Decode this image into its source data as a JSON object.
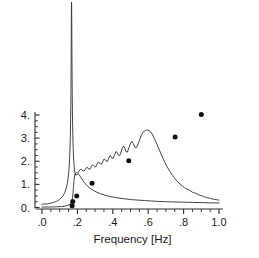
{
  "chart_data": {
    "type": "line",
    "title": "",
    "xlabel": "Frequency [Hz]",
    "ylabel": "",
    "xlim": [
      0.0,
      1.0
    ],
    "ylim": [
      0.0,
      4.55
    ],
    "grid": false,
    "legend": "none",
    "xticks": [
      0.0,
      0.2,
      0.4,
      0.6,
      0.8,
      1.0
    ],
    "xticklabels": [
      ".0",
      ".2",
      ".4",
      ".6",
      ".8",
      "1.0"
    ],
    "xminor_step": 0.05,
    "yticks": [
      0,
      1,
      2,
      3,
      4
    ],
    "yticklabels": [
      "0.",
      "1.",
      "2.",
      "3.",
      "4."
    ],
    "yminor_step": 0.25,
    "note": "Narrow resonance curve is clipped by the top of the axes near f=0.165",
    "series": [
      {
        "name": "narrow-resonance-curve",
        "type": "line",
        "clipped_at_top": true,
        "points": [
          [
            0.0,
            0.14
          ],
          [
            0.015,
            0.15
          ],
          [
            0.03,
            0.16
          ],
          [
            0.045,
            0.18
          ],
          [
            0.06,
            0.21
          ],
          [
            0.07,
            0.23
          ],
          [
            0.08,
            0.26
          ],
          [
            0.09,
            0.3
          ],
          [
            0.1,
            0.36
          ],
          [
            0.108,
            0.41
          ],
          [
            0.115,
            0.47
          ],
          [
            0.122,
            0.55
          ],
          [
            0.128,
            0.64
          ],
          [
            0.134,
            0.76
          ],
          [
            0.139,
            0.9
          ],
          [
            0.143,
            1.05
          ],
          [
            0.147,
            1.25
          ],
          [
            0.15,
            1.45
          ],
          [
            0.153,
            1.72
          ],
          [
            0.156,
            2.1
          ],
          [
            0.158,
            2.5
          ],
          [
            0.16,
            3.05
          ],
          [
            0.1615,
            3.7
          ],
          [
            0.1628,
            4.4
          ],
          [
            0.1638,
            5.2
          ],
          [
            0.1645,
            6.1
          ],
          [
            0.1652,
            7.2
          ],
          [
            0.1658,
            8.4
          ],
          [
            0.1663,
            9.3
          ],
          [
            0.1668,
            9.6
          ],
          [
            0.1673,
            9.1
          ],
          [
            0.168,
            8.1
          ],
          [
            0.1688,
            7.0
          ],
          [
            0.1697,
            5.9
          ],
          [
            0.1708,
            4.9
          ],
          [
            0.172,
            4.05
          ],
          [
            0.1735,
            3.35
          ],
          [
            0.1752,
            2.8
          ],
          [
            0.1772,
            2.35
          ],
          [
            0.1795,
            2.0
          ],
          [
            0.1825,
            1.72
          ],
          [
            0.186,
            1.52
          ],
          [
            0.19,
            1.4
          ],
          [
            0.1945,
            1.4
          ],
          [
            0.199,
            1.44
          ],
          [
            0.204,
            1.46
          ],
          [
            0.21,
            1.42
          ],
          [
            0.218,
            1.32
          ],
          [
            0.228,
            1.2
          ],
          [
            0.24,
            1.07
          ],
          [
            0.255,
            0.94
          ],
          [
            0.272,
            0.83
          ],
          [
            0.29,
            0.74
          ],
          [
            0.31,
            0.66
          ],
          [
            0.332,
            0.59
          ],
          [
            0.356,
            0.53
          ],
          [
            0.382,
            0.48
          ],
          [
            0.41,
            0.44
          ],
          [
            0.44,
            0.4
          ],
          [
            0.472,
            0.37
          ],
          [
            0.506,
            0.34
          ],
          [
            0.542,
            0.32
          ],
          [
            0.58,
            0.3
          ],
          [
            0.62,
            0.28
          ],
          [
            0.662,
            0.26
          ],
          [
            0.706,
            0.25
          ],
          [
            0.752,
            0.24
          ],
          [
            0.8,
            0.23
          ],
          [
            0.85,
            0.22
          ],
          [
            0.902,
            0.21
          ],
          [
            0.95,
            0.2
          ],
          [
            1.0,
            0.2
          ]
        ]
      },
      {
        "name": "broad-rippled-curve",
        "type": "line",
        "points": [
          [
            0.0,
            0.02
          ],
          [
            0.04,
            0.02
          ],
          [
            0.08,
            0.03
          ],
          [
            0.11,
            0.04
          ],
          [
            0.13,
            0.06
          ],
          [
            0.145,
            0.09
          ],
          [
            0.155,
            0.13
          ],
          [
            0.162,
            0.18
          ],
          [
            0.168,
            0.26
          ],
          [
            0.172,
            0.4
          ],
          [
            0.175,
            0.62
          ],
          [
            0.178,
            0.9
          ],
          [
            0.181,
            1.18
          ],
          [
            0.184,
            1.38
          ],
          [
            0.188,
            1.47
          ],
          [
            0.193,
            1.5
          ],
          [
            0.199,
            1.5
          ],
          [
            0.206,
            1.53
          ],
          [
            0.213,
            1.61
          ],
          [
            0.219,
            1.66
          ],
          [
            0.225,
            1.63
          ],
          [
            0.231,
            1.58
          ],
          [
            0.238,
            1.58
          ],
          [
            0.245,
            1.66
          ],
          [
            0.252,
            1.74
          ],
          [
            0.258,
            1.72
          ],
          [
            0.264,
            1.66
          ],
          [
            0.271,
            1.66
          ],
          [
            0.278,
            1.76
          ],
          [
            0.285,
            1.84
          ],
          [
            0.291,
            1.82
          ],
          [
            0.297,
            1.76
          ],
          [
            0.304,
            1.76
          ],
          [
            0.311,
            1.88
          ],
          [
            0.318,
            1.96
          ],
          [
            0.324,
            1.94
          ],
          [
            0.33,
            1.88
          ],
          [
            0.337,
            1.88
          ],
          [
            0.344,
            2.0
          ],
          [
            0.351,
            2.1
          ],
          [
            0.357,
            2.07
          ],
          [
            0.363,
            2.0
          ],
          [
            0.37,
            2.0
          ],
          [
            0.377,
            2.13
          ],
          [
            0.384,
            2.24
          ],
          [
            0.39,
            2.21
          ],
          [
            0.396,
            2.13
          ],
          [
            0.403,
            2.13
          ],
          [
            0.41,
            2.28
          ],
          [
            0.418,
            2.42
          ],
          [
            0.425,
            2.38
          ],
          [
            0.432,
            2.26
          ],
          [
            0.439,
            2.24
          ],
          [
            0.447,
            2.4
          ],
          [
            0.455,
            2.6
          ],
          [
            0.462,
            2.66
          ],
          [
            0.469,
            2.54
          ],
          [
            0.476,
            2.4
          ],
          [
            0.483,
            2.4
          ],
          [
            0.491,
            2.58
          ],
          [
            0.5,
            2.78
          ],
          [
            0.508,
            2.86
          ],
          [
            0.516,
            2.76
          ],
          [
            0.524,
            2.62
          ],
          [
            0.532,
            2.58
          ],
          [
            0.541,
            2.7
          ],
          [
            0.551,
            2.92
          ],
          [
            0.562,
            3.14
          ],
          [
            0.574,
            3.28
          ],
          [
            0.586,
            3.34
          ],
          [
            0.598,
            3.35
          ],
          [
            0.61,
            3.3
          ],
          [
            0.622,
            3.18
          ],
          [
            0.634,
            3.0
          ],
          [
            0.646,
            2.8
          ],
          [
            0.658,
            2.58
          ],
          [
            0.67,
            2.36
          ],
          [
            0.683,
            2.13
          ],
          [
            0.696,
            1.92
          ],
          [
            0.71,
            1.72
          ],
          [
            0.724,
            1.54
          ],
          [
            0.738,
            1.38
          ],
          [
            0.752,
            1.24
          ],
          [
            0.766,
            1.12
          ],
          [
            0.78,
            1.01
          ],
          [
            0.794,
            0.92
          ],
          [
            0.806,
            0.85
          ],
          [
            0.816,
            0.8
          ],
          [
            0.824,
            0.78
          ],
          [
            0.832,
            0.75
          ],
          [
            0.842,
            0.7
          ],
          [
            0.852,
            0.65
          ],
          [
            0.86,
            0.63
          ],
          [
            0.868,
            0.62
          ],
          [
            0.876,
            0.59
          ],
          [
            0.886,
            0.55
          ],
          [
            0.894,
            0.52
          ],
          [
            0.902,
            0.51
          ],
          [
            0.91,
            0.49
          ],
          [
            0.92,
            0.46
          ],
          [
            0.928,
            0.43
          ],
          [
            0.936,
            0.42
          ],
          [
            0.944,
            0.41
          ],
          [
            0.952,
            0.39
          ],
          [
            0.96,
            0.37
          ],
          [
            0.968,
            0.36
          ],
          [
            0.976,
            0.35
          ],
          [
            0.984,
            0.34
          ],
          [
            0.992,
            0.33
          ],
          [
            1.0,
            0.32
          ]
        ]
      },
      {
        "name": "measured-data-points",
        "type": "scatter",
        "marker": "filled-circle",
        "points": [
          [
            0.17,
            0.08
          ],
          [
            0.174,
            0.26
          ],
          [
            0.196,
            0.5
          ],
          [
            0.283,
            1.05
          ],
          [
            0.49,
            2.02
          ],
          [
            0.752,
            3.05
          ],
          [
            0.9,
            4.02
          ]
        ]
      }
    ]
  }
}
